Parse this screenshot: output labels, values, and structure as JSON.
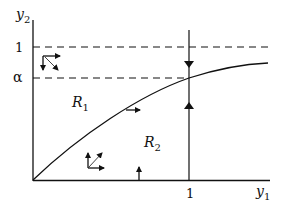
{
  "diagram": {
    "type": "phase-plane",
    "axes": {
      "x_label_base": "y",
      "x_label_sub": "1",
      "y_label_base": "y",
      "y_label_sub": "2"
    },
    "ticks": {
      "x_one": "1",
      "y_one": "1",
      "y_alpha": "α"
    },
    "regions": [
      {
        "base": "R",
        "sub": "1"
      },
      {
        "base": "R",
        "sub": "2"
      }
    ],
    "curve": "increasing concave curve from origin, crossing y1=1 at y2=α and approaching y2=1",
    "lines": [
      {
        "name": "y2 = 1",
        "style": "dashed"
      },
      {
        "name": "y2 = α",
        "style": "dashed"
      },
      {
        "name": "y1 = 1",
        "style": "solid"
      }
    ],
    "direction_arrows": [
      "down arrow on y1=1 above curve",
      "up arrow on y1=1 below curve",
      "right arrow on curve",
      "up arrow on y1 axis",
      "right/down/diagonal triad in region above y2=α",
      "up/right/diagonal triad in region R2"
    ]
  }
}
